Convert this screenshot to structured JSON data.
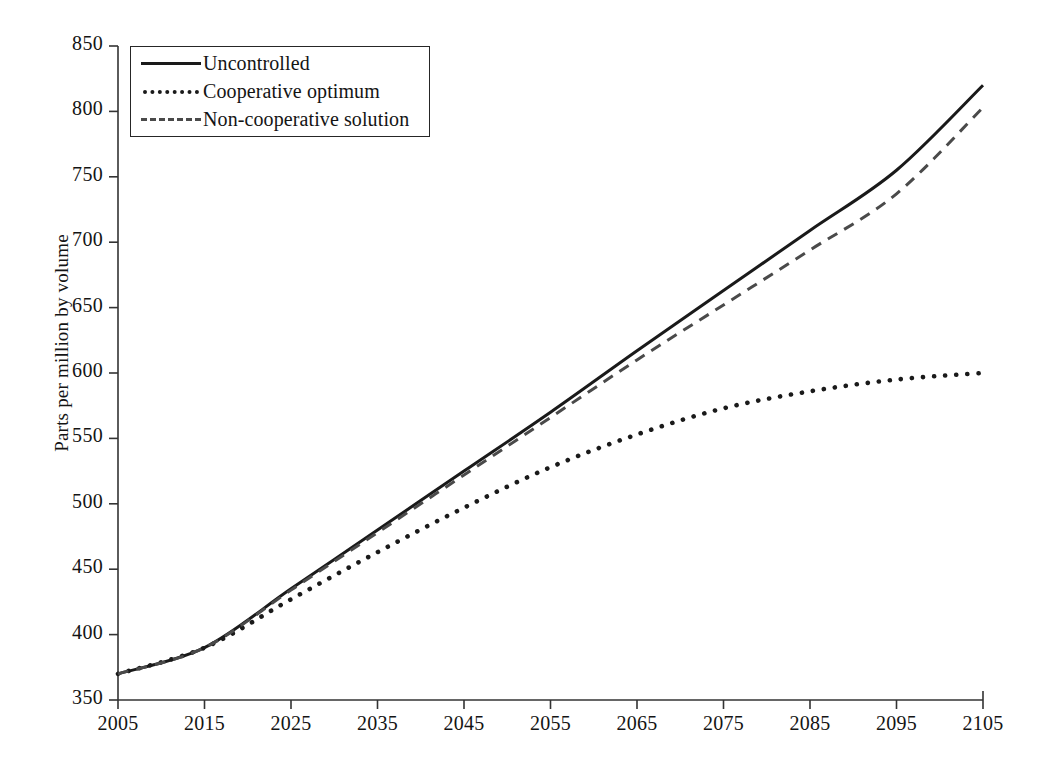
{
  "chart_data": {
    "type": "line",
    "title": "",
    "xlabel": "",
    "ylabel": "Parts per million by volume",
    "xlim": [
      2005,
      2105
    ],
    "ylim": [
      350,
      850
    ],
    "grid": false,
    "legend_position": "top-left",
    "x": [
      2005,
      2015,
      2025,
      2035,
      2045,
      2055,
      2065,
      2075,
      2085,
      2095,
      2105
    ],
    "xticklabels": [
      "2005",
      "2015",
      "2025",
      "2035",
      "2045",
      "2055",
      "2065",
      "2075",
      "2085",
      "2095",
      "2105"
    ],
    "yticks": [
      350,
      400,
      450,
      500,
      550,
      600,
      650,
      700,
      750,
      800,
      850
    ],
    "yticklabels": [
      "350",
      "400",
      "450",
      "500",
      "550",
      "600",
      "650",
      "700",
      "750",
      "800",
      "850"
    ],
    "series": [
      {
        "name": "Uncontrolled",
        "style": "solid",
        "color": "#1a1a1a",
        "values": [
          370,
          390,
          435,
          480,
          525,
          570,
          617,
          663,
          709,
          755,
          820
        ]
      },
      {
        "name": "Cooperative optimum",
        "style": "dotted",
        "color": "#1a1a1a",
        "values": [
          370,
          390,
          427,
          463,
          497,
          528,
          553,
          573,
          586,
          595,
          600
        ]
      },
      {
        "name": "Non-cooperative solution",
        "style": "dashed",
        "color": "#4a4a4a",
        "values": [
          370,
          390,
          434,
          478,
          522,
          566,
          610,
          652,
          694,
          737,
          803
        ]
      }
    ]
  },
  "axis": {
    "y_title": "Parts per million by volume"
  },
  "legend": {
    "items": [
      {
        "label": "Uncontrolled",
        "style": "solid"
      },
      {
        "label": "Cooperative optimum",
        "style": "dotted"
      },
      {
        "label": "Non-cooperative solution",
        "style": "dashed"
      }
    ]
  }
}
